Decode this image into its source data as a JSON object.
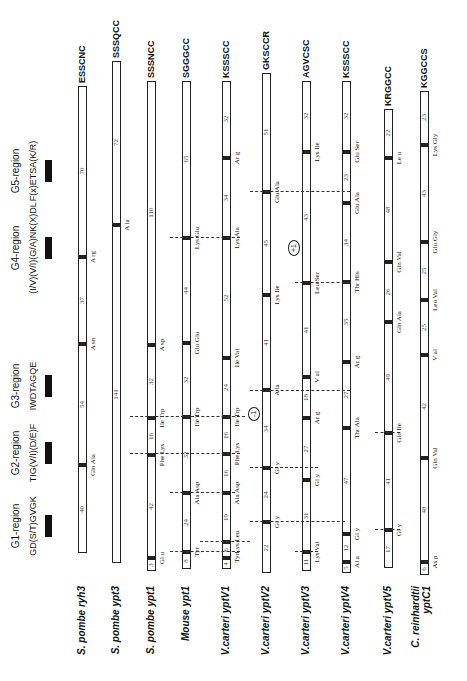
{
  "regions": [
    {
      "label": "G1-region",
      "motif": "GD(S/T)GVGK",
      "x": 155
    },
    {
      "label": "G2-region",
      "motif": "TIG(V/I)(D/E)F",
      "x": 228
    },
    {
      "label": "G3-region",
      "motif": "IWDTAGQE",
      "x": 295
    },
    {
      "label": "G4-region",
      "motif": "(I/V)(V/I)(G/A)NK(X)DL",
      "x": 433
    },
    {
      "label": "G5-region",
      "motif": "F(x)ETSA(K/R)",
      "x": 510
    }
  ],
  "genes": [
    {
      "name": "S. pombe ryh3",
      "tail": "ESSCNC",
      "exons": [
        {
          "start": 128,
          "end": 215,
          "num": "40"
        },
        {
          "start": 217,
          "end": 336,
          "num": "54"
        },
        {
          "start": 338,
          "end": 423,
          "num": "37"
        },
        {
          "start": 425,
          "end": 595,
          "num": "70"
        }
      ],
      "aa": [
        {
          "x": 216,
          "label": "Gln  Ala"
        },
        {
          "x": 337,
          "label": "A  sn"
        },
        {
          "x": 424,
          "label": "A  rg"
        }
      ]
    },
    {
      "name": "S. pombe ypt3",
      "tail": "SSSQCC",
      "exons": [
        {
          "start": 118,
          "end": 455,
          "num": "141"
        },
        {
          "start": 457,
          "end": 620,
          "num": "72"
        }
      ],
      "aa": [
        {
          "x": 456,
          "label": "A  la"
        }
      ]
    },
    {
      "name": "S. pombe ypt1",
      "tail": "SSSNCC",
      "exons": [
        {
          "start": 110,
          "end": 122,
          "num": "3"
        },
        {
          "start": 124,
          "end": 225,
          "num": "42"
        },
        {
          "start": 227,
          "end": 262,
          "num": "16"
        },
        {
          "start": 264,
          "end": 335,
          "num": "32"
        },
        {
          "start": 337,
          "end": 600,
          "num": "110"
        }
      ],
      "aa": [
        {
          "x": 123,
          "label": "Gl  u"
        },
        {
          "x": 226,
          "label": "Phe  Lys"
        },
        {
          "x": 263,
          "label": "Ile  Trp"
        },
        {
          "x": 336,
          "label": "A  sp"
        }
      ]
    },
    {
      "name": "Mouse ypt1",
      "tail": "SGGGCC",
      "exons": [
        {
          "start": 112,
          "end": 128,
          "num": "8"
        },
        {
          "start": 130,
          "end": 187,
          "num": "24"
        },
        {
          "start": 189,
          "end": 263,
          "num": "32"
        },
        {
          "start": 265,
          "end": 337,
          "num": "32"
        },
        {
          "start": 339,
          "end": 442,
          "num": "44"
        },
        {
          "start": 444,
          "end": 600,
          "num": "65"
        }
      ],
      "aa": [
        {
          "x": 129,
          "label": "Tyr"
        },
        {
          "x": 188,
          "label": "Ala  Asp"
        },
        {
          "x": 264,
          "label": "Ile  Trp"
        },
        {
          "x": 338,
          "label": "Glu  Glu"
        },
        {
          "x": 443,
          "label": "Lys  Glu"
        }
      ]
    },
    {
      "name": "V.carteri  yptV1",
      "tail": "KSSSCC",
      "exons": [
        {
          "start": 112,
          "end": 122,
          "num": "4"
        },
        {
          "start": 124,
          "end": 138,
          "num": "6"
        },
        {
          "start": 140,
          "end": 187,
          "num": "19"
        },
        {
          "start": 189,
          "end": 226,
          "num": "16"
        },
        {
          "start": 228,
          "end": 263,
          "num": "16"
        },
        {
          "start": 265,
          "end": 322,
          "num": "24"
        },
        {
          "start": 324,
          "end": 442,
          "num": "52"
        },
        {
          "start": 444,
          "end": 522,
          "num": "34"
        },
        {
          "start": 524,
          "end": 600,
          "num": "32"
        }
      ],
      "aa": [
        {
          "x": 123,
          "label": "Tyr"
        },
        {
          "x": 139,
          "label": "Lys  Leu"
        },
        {
          "x": 188,
          "label": "Ala  Asp"
        },
        {
          "x": 227,
          "label": "Phe  Lys"
        },
        {
          "x": 264,
          "label": "Ile  Trp"
        },
        {
          "x": 323,
          "label": "Ile  Val"
        },
        {
          "x": 443,
          "label": "Lys  Ala"
        },
        {
          "x": 523,
          "label": "Ar  g"
        }
      ]
    },
    {
      "name": "V.carteri  yptV2",
      "tail": "GKSCCR",
      "exons": [
        {
          "start": 108,
          "end": 158,
          "num": "22"
        },
        {
          "start": 160,
          "end": 212,
          "num": "24"
        },
        {
          "start": 214,
          "end": 290,
          "num": "34"
        },
        {
          "start": 292,
          "end": 385,
          "num": "41"
        },
        {
          "start": 387,
          "end": 488,
          "num": "45"
        },
        {
          "start": 490,
          "end": 608,
          "num": "51"
        }
      ],
      "aa": [
        {
          "x": 159,
          "label": "Gl  y"
        },
        {
          "x": 213,
          "label": "Gl  y"
        },
        {
          "x": 291,
          "label": "A  la"
        },
        {
          "x": 386,
          "label": "Lys  Ile"
        },
        {
          "x": 489,
          "label": "Glu  Ala"
        }
      ],
      "phase": {
        "x": 260,
        "label": "-1"
      }
    },
    {
      "name": "V.carteri  yptV3",
      "tail": "AGVCSC",
      "exons": [
        {
          "start": 110,
          "end": 128,
          "num": "11"
        },
        {
          "start": 130,
          "end": 200,
          "num": "31"
        },
        {
          "start": 202,
          "end": 262,
          "num": "27"
        },
        {
          "start": 264,
          "end": 303,
          "num": "18"
        },
        {
          "start": 305,
          "end": 397,
          "num": "41"
        },
        {
          "start": 399,
          "end": 528,
          "num": "43"
        },
        {
          "start": 530,
          "end": 600,
          "num": "32"
        }
      ],
      "aa": [
        {
          "x": 129,
          "label": "Lys  Val"
        },
        {
          "x": 201,
          "label": "Gl  y"
        },
        {
          "x": 263,
          "label": "Ar  g"
        },
        {
          "x": 304,
          "label": "V  al"
        },
        {
          "x": 398,
          "label": "Leu  Ser"
        },
        {
          "x": 529,
          "label": "Lys  Ile"
        }
      ],
      "phase": {
        "x": 425,
        "label": "+1"
      }
    },
    {
      "name": "V.carteri  yptV4",
      "tail": "KSSSCC",
      "exons": [
        {
          "start": 108,
          "end": 118,
          "num": "5"
        },
        {
          "start": 120,
          "end": 146,
          "num": "12"
        },
        {
          "start": 148,
          "end": 252,
          "num": "47"
        },
        {
          "start": 254,
          "end": 318,
          "num": "27"
        },
        {
          "start": 320,
          "end": 398,
          "num": "35"
        },
        {
          "start": 400,
          "end": 477,
          "num": "34"
        },
        {
          "start": 479,
          "end": 528,
          "num": "23"
        },
        {
          "start": 530,
          "end": 600,
          "num": "32"
        }
      ],
      "aa": [
        {
          "x": 119,
          "label": "Al  a"
        },
        {
          "x": 147,
          "label": "Gl  y"
        },
        {
          "x": 253,
          "label": "Thr  Ala"
        },
        {
          "x": 319,
          "label": "Ar  g"
        },
        {
          "x": 399,
          "label": "Thr  His"
        },
        {
          "x": 478,
          "label": "Glu  Ala"
        },
        {
          "x": 529,
          "label": "Glu  Ser"
        }
      ]
    },
    {
      "name": "V.carteri  yptV5",
      "tail": "KRGGCC",
      "exons": [
        {
          "start": 113,
          "end": 150,
          "num": "17"
        },
        {
          "start": 152,
          "end": 247,
          "num": "41"
        },
        {
          "start": 249,
          "end": 358,
          "num": "49"
        },
        {
          "start": 360,
          "end": 418,
          "num": "26"
        },
        {
          "start": 420,
          "end": 522,
          "num": "48"
        },
        {
          "start": 524,
          "end": 572,
          "num": "22"
        }
      ],
      "aa": [
        {
          "x": 151,
          "label": "Gl  y"
        },
        {
          "x": 248,
          "label": "Gln  Ile"
        },
        {
          "x": 359,
          "label": "Gln  Ala"
        },
        {
          "x": 419,
          "label": "Gln  Val"
        },
        {
          "x": 523,
          "label": "Le  u"
        }
      ]
    },
    {
      "name": "C. reinhardtii yptC1",
      "tail": "KGGCCS",
      "exons": [
        {
          "start": 106,
          "end": 118,
          "num": "6"
        },
        {
          "start": 120,
          "end": 222,
          "num": "48"
        },
        {
          "start": 224,
          "end": 325,
          "num": "42"
        },
        {
          "start": 327,
          "end": 380,
          "num": "25"
        },
        {
          "start": 382,
          "end": 438,
          "num": "25"
        },
        {
          "start": 440,
          "end": 535,
          "num": "43"
        },
        {
          "start": 537,
          "end": 590,
          "num": "23"
        }
      ],
      "aa": [
        {
          "x": 119,
          "label": "As  p"
        },
        {
          "x": 223,
          "label": "Gln  Val"
        },
        {
          "x": 326,
          "label": "V  al"
        },
        {
          "x": 381,
          "label": "Leu  Val"
        },
        {
          "x": 439,
          "label": "Glu  Gly"
        },
        {
          "x": 536,
          "label": "Lys  Gly"
        }
      ]
    }
  ],
  "gene_y": [
    78,
    112,
    147,
    182,
    222,
    262,
    302,
    342,
    384,
    420
  ],
  "dashes": [
    {
      "x": 129,
      "from": 170,
      "to": 240
    },
    {
      "x": 139,
      "from": 200,
      "to": 250
    },
    {
      "x": 188,
      "from": 170,
      "to": 235
    },
    {
      "x": 227,
      "from": 130,
      "to": 240
    },
    {
      "x": 264,
      "from": 130,
      "to": 245
    },
    {
      "x": 443,
      "from": 170,
      "to": 240
    },
    {
      "x": 159,
      "from": 250,
      "to": 345
    },
    {
      "x": 213,
      "from": 250,
      "to": 318
    },
    {
      "x": 290,
      "from": 250,
      "to": 350
    },
    {
      "x": 489,
      "from": 250,
      "to": 350
    },
    {
      "x": 129,
      "from": 295,
      "to": 318
    },
    {
      "x": 398,
      "from": 295,
      "to": 350
    },
    {
      "x": 248,
      "from": 375,
      "to": 400
    },
    {
      "x": 151,
      "from": 375,
      "to": 400
    }
  ]
}
